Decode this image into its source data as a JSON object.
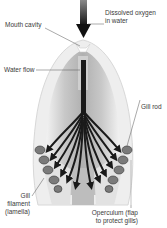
{
  "diagram": {
    "labels": {
      "dissolved_oxygen_line1": "Dissolved oxygen",
      "dissolved_oxygen_line2": "in water",
      "mouth_cavity": "Mouth cavity",
      "water_flow": "Water flow",
      "gill_rod": "Gill rod",
      "gill_filament_line1": "Gill",
      "gill_filament_line2": "filament",
      "gill_filament_line3": "(lamella)",
      "operculum_line1": "Operculum (flap",
      "operculum_line2": "to protect gills)"
    },
    "colors": {
      "arrow": "#1a1a1a",
      "body_outer": "#e6e6e6",
      "body_inner": "#c4c4c4",
      "body_dark": "#9a9a9a",
      "leader_line": "#555555",
      "label_text": "#3a3a3a"
    }
  }
}
